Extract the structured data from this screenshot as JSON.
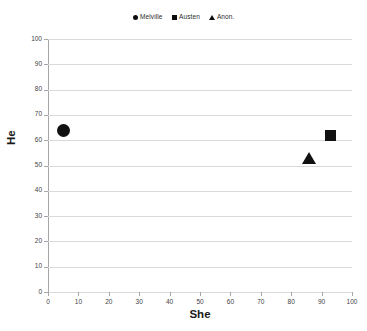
{
  "chart_data": {
    "type": "scatter",
    "title": "",
    "xlabel": "She",
    "ylabel": "He",
    "xlim": [
      0,
      100
    ],
    "ylim": [
      0,
      100
    ],
    "xticks": [
      0,
      10,
      20,
      30,
      40,
      50,
      60,
      70,
      80,
      90,
      100
    ],
    "yticks": [
      0,
      10,
      20,
      30,
      40,
      50,
      60,
      70,
      80,
      90,
      100
    ],
    "grid": "horizontal",
    "legend_position": "top-center",
    "marker_color": "#111111",
    "gridline_color": "#d9d9d9",
    "axis_color": "#a6a6a6",
    "series": [
      {
        "name": "Melville",
        "marker": "circle",
        "x": 5,
        "y": 64
      },
      {
        "name": "Austen",
        "marker": "square",
        "x": 93,
        "y": 62
      },
      {
        "name": "Anon.",
        "marker": "triangle",
        "x": 86,
        "y": 53
      }
    ]
  },
  "legend": {
    "entries": [
      {
        "label": "Melville",
        "marker": "circle"
      },
      {
        "label": "Austen",
        "marker": "square"
      },
      {
        "label": "Anon.",
        "marker": "triangle"
      }
    ]
  }
}
